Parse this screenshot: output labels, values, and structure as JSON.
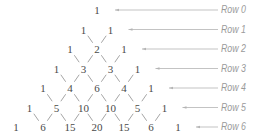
{
  "diagram": {
    "colors": {
      "numbers": "#4a4a4a",
      "connectors": "#9a9a9a",
      "arrows": "#b4b4b4",
      "labels": "#9a9a9a"
    },
    "rows": [
      {
        "label": "Row 0",
        "values": [
          "1"
        ]
      },
      {
        "label": "Row 1",
        "values": [
          "1",
          "1"
        ]
      },
      {
        "label": "Row 2",
        "values": [
          "1",
          "2",
          "1"
        ]
      },
      {
        "label": "Row 3",
        "values": [
          "1",
          "3",
          "3",
          "1"
        ]
      },
      {
        "label": "Row 4",
        "values": [
          "1",
          "4",
          "6",
          "4",
          "1"
        ]
      },
      {
        "label": "Row 5",
        "values": [
          "1",
          "5",
          "10",
          "10",
          "5",
          "1"
        ]
      },
      {
        "label": "Row 6",
        "values": [
          "1",
          "6",
          "15",
          "20",
          "15",
          "6",
          "1"
        ]
      }
    ]
  }
}
